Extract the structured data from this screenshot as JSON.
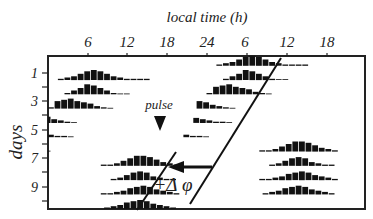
{
  "chart_data": {
    "type": "actogram",
    "title": "",
    "xlabel": "local time (h)",
    "ylabel": "days",
    "x_ticks": [
      "6",
      "12",
      "18",
      "24",
      "6",
      "12",
      "18"
    ],
    "y_ticks": [
      "1",
      "3",
      "5",
      "7",
      "9"
    ],
    "annotations": {
      "pulse_label": "pulse",
      "phase_shift_label": "+Δ φ"
    },
    "double_plotted": true,
    "hours_span": 48,
    "rows": [
      {
        "day": 1,
        "onset_h": 1.5,
        "bins": [
          1,
          2,
          3,
          5,
          7,
          8,
          7,
          5,
          3,
          2,
          1,
          1,
          1,
          1
        ]
      },
      {
        "day": 2,
        "onset_h": 2.5,
        "bins": [
          1,
          3,
          5,
          8,
          7,
          5,
          3,
          1,
          0,
          0
        ]
      },
      {
        "day": 3,
        "onset_h": 0.0,
        "bins": [
          1,
          6,
          7,
          8,
          6,
          5,
          4,
          2,
          1,
          0
        ]
      },
      {
        "day": 4,
        "onset_h": -1.5,
        "bins": [
          6,
          5,
          3,
          2,
          1,
          0
        ]
      },
      {
        "day": 5,
        "onset_h": -2.0,
        "bins": [
          4,
          3,
          2,
          1,
          1,
          0
        ]
      },
      {
        "day": 6,
        "onset_h": -3.5,
        "bins": [
          2,
          1,
          1,
          0
        ]
      },
      {
        "day": 7,
        "onset_h": 8.0,
        "bins": [
          1,
          1,
          2,
          4,
          6,
          8,
          8,
          7,
          5,
          3,
          2,
          1
        ]
      },
      {
        "day": 8,
        "onset_h": 9.5,
        "bins": [
          1,
          2,
          4,
          6,
          7,
          6,
          3,
          2,
          1,
          1
        ]
      },
      {
        "day": 9,
        "onset_h": 8.0,
        "bins": [
          1,
          1,
          2,
          3,
          5,
          6,
          7,
          6,
          4,
          3,
          2,
          1
        ]
      },
      {
        "day": 10,
        "onset_h": 8.5,
        "bins": [
          1,
          2,
          3,
          5,
          6,
          7,
          6,
          4,
          3,
          2,
          1
        ]
      }
    ],
    "colors": {
      "bars": "#111111",
      "axes": "#222222",
      "background": "#ffffff"
    }
  }
}
